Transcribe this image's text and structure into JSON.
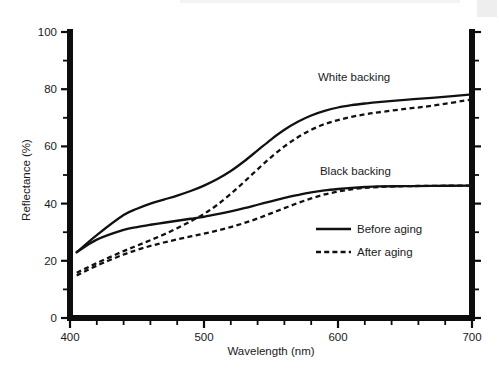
{
  "chart_data": {
    "type": "line",
    "title": "",
    "xlabel": "Wavelength (nm)",
    "ylabel": "Reflectance (%)",
    "xlim": [
      400,
      700
    ],
    "ylim": [
      0,
      100
    ],
    "xticks": [
      400,
      500,
      600,
      700
    ],
    "yticks": [
      0,
      20,
      40,
      60,
      80,
      100
    ],
    "xtick_labels": [
      "400",
      "500",
      "600",
      "700"
    ],
    "ytick_labels": [
      "0",
      "20",
      "40",
      "60",
      "80",
      "100"
    ],
    "x_minor_tick_step": 20,
    "y_minor_tick_step": 10,
    "grid": false,
    "legend_position": "center-right",
    "annotations": [
      {
        "text": "White backing",
        "x": 612,
        "y": 83
      },
      {
        "text": "Black backing",
        "x": 613,
        "y": 50
      }
    ],
    "legend": [
      {
        "label": "Before aging",
        "style": "solid"
      },
      {
        "label": "After aging",
        "style": "dashed"
      }
    ],
    "x": [
      405,
      420,
      440,
      450,
      460,
      470,
      480,
      490,
      500,
      510,
      520,
      530,
      540,
      550,
      560,
      570,
      580,
      590,
      600,
      610,
      620,
      630,
      650,
      670,
      700
    ],
    "series": [
      {
        "name": "White backing, Before aging",
        "group": "White backing",
        "style": "solid",
        "values": [
          23.0,
          29.0,
          36.0,
          38.2,
          40.0,
          41.4,
          42.8,
          44.4,
          46.3,
          48.6,
          51.4,
          54.8,
          58.6,
          62.4,
          65.8,
          68.6,
          70.8,
          72.4,
          73.6,
          74.4,
          75.0,
          75.5,
          76.3,
          77.0,
          78.2
        ]
      },
      {
        "name": "White backing, After aging",
        "group": "White backing",
        "style": "dashed",
        "values": [
          15.8,
          19.2,
          23.4,
          25.3,
          27.2,
          29.2,
          31.4,
          33.8,
          36.4,
          39.6,
          43.4,
          47.6,
          52.0,
          56.2,
          60.0,
          63.2,
          65.8,
          67.8,
          69.2,
          70.3,
          71.2,
          71.9,
          73.1,
          74.2,
          76.4
        ]
      },
      {
        "name": "Black backing, Before aging",
        "group": "Black backing",
        "style": "solid",
        "values": [
          23.0,
          27.4,
          30.8,
          31.8,
          32.6,
          33.3,
          34.0,
          34.7,
          35.4,
          36.3,
          37.3,
          38.4,
          39.6,
          40.8,
          42.0,
          43.0,
          43.9,
          44.6,
          45.1,
          45.5,
          45.8,
          46.0,
          46.1,
          46.2,
          46.3
        ]
      },
      {
        "name": "Black backing, After aging",
        "group": "Black backing",
        "style": "dashed",
        "values": [
          14.9,
          18.3,
          22.2,
          23.8,
          25.2,
          26.4,
          27.5,
          28.5,
          29.5,
          30.6,
          31.8,
          33.2,
          34.8,
          36.6,
          38.4,
          40.2,
          41.8,
          43.2,
          44.2,
          45.0,
          45.5,
          45.8,
          46.1,
          46.2,
          46.3
        ]
      }
    ]
  }
}
